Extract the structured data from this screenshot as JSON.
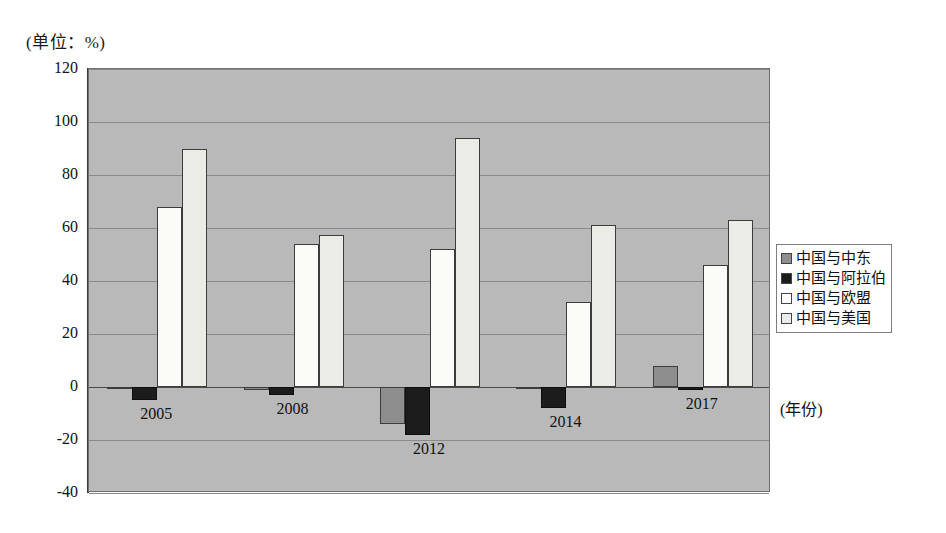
{
  "figure": {
    "unit_label": "(单位：%)",
    "xaxis_title": "(年份)"
  },
  "chart_data": {
    "type": "bar",
    "title": "",
    "subtitle": "",
    "xlabel": "(年份)",
    "ylabel": "(单位：%)",
    "ylim": [
      -40,
      120
    ],
    "yticks": [
      120,
      100,
      80,
      60,
      40,
      20,
      0,
      -20,
      -40
    ],
    "ytick_labels": [
      "120",
      "100",
      "80",
      "60",
      "40",
      "20",
      "0",
      "-20",
      "-40"
    ],
    "grid": true,
    "legend_position": "right",
    "categories": [
      "2005",
      "2008",
      "2012",
      "2014",
      "2017"
    ],
    "series": [
      {
        "name": "中国与中东",
        "color": "#8e8e8e",
        "values": [
          0,
          -1,
          -14,
          -0.5,
          8
        ]
      },
      {
        "name": "中国与阿拉伯",
        "color": "#1c1c1c",
        "values": [
          -5,
          -3,
          -18,
          -8,
          -1
        ]
      },
      {
        "name": "中国与欧盟",
        "color": "#ffffff",
        "values": [
          68,
          54,
          52,
          32,
          46
        ]
      },
      {
        "name": "中国与美国",
        "color": "#ececec",
        "values": [
          90,
          57.5,
          94,
          61,
          63
        ]
      }
    ]
  },
  "legend": {
    "items": [
      {
        "label": "中国与中东"
      },
      {
        "label": "中国与阿拉伯"
      },
      {
        "label": "中国与欧盟"
      },
      {
        "label": "中国与美国"
      }
    ]
  }
}
